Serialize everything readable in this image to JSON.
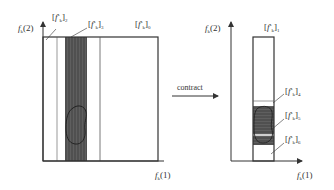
{
  "diagram": {
    "left_panel": {
      "y_axis_label": {
        "var": "f",
        "sub": "k",
        "arg": "(2)"
      },
      "x_axis_label": {
        "var": "f",
        "sub": "k",
        "arg": "(1)"
      },
      "interval_labels": [
        {
          "id": "2",
          "base": "f",
          "sub": "k",
          "sup": "s",
          "index": "2"
        },
        {
          "id": "3",
          "base": "f",
          "sub": "k",
          "sup": "s",
          "index": "3"
        },
        {
          "id": "0",
          "base": "f",
          "sub": "k",
          "sup": "s",
          "index": "0"
        }
      ]
    },
    "arrow": {
      "label": "contract"
    },
    "right_panel": {
      "y_axis_label": {
        "var": "f",
        "sub": "k",
        "arg": "(2)"
      },
      "x_axis_label": {
        "var": "f",
        "sub": "k",
        "arg": "(1)"
      },
      "interval_labels": [
        {
          "id": "1",
          "base": "f",
          "sub": "k",
          "sup": "s",
          "index": "1"
        },
        {
          "id": "4",
          "base": "f",
          "sub": "k",
          "sup": "s",
          "index": "4"
        },
        {
          "id": "5",
          "base": "f",
          "sub": "k",
          "sup": "s",
          "index": "5"
        },
        {
          "id": "6",
          "base": "f",
          "sub": "k",
          "sup": "s",
          "index": "6"
        }
      ]
    },
    "colors": {
      "line": "#333333",
      "dark_band": "#555555",
      "blob_stroke": "#222222",
      "light_stripe": "#cccccc"
    }
  }
}
